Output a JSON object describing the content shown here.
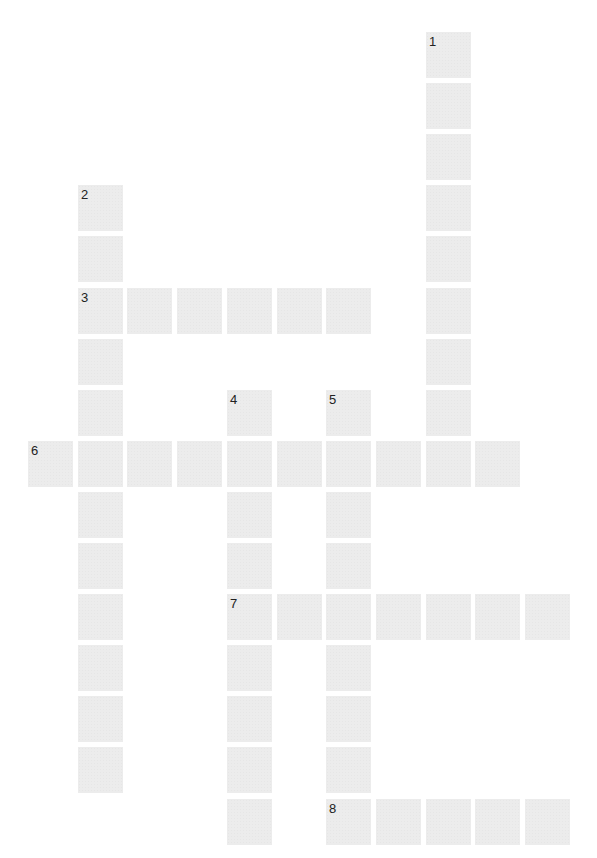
{
  "puzzle": {
    "title": "",
    "cell_color": "#ececec",
    "number_color": "#222222",
    "grid": {
      "col_origin_x": 28,
      "col_pitch": 49.7,
      "row_origin_y": 32,
      "row_pitch": 51.1,
      "cell_width": 45,
      "cell_height": 46
    },
    "words": [
      {
        "number": "1",
        "direction": "down",
        "row": 0,
        "col": 8,
        "length": 8
      },
      {
        "number": "2",
        "direction": "down",
        "row": 3,
        "col": 1,
        "length": 12
      },
      {
        "number": "3",
        "direction": "across",
        "row": 5,
        "col": 1,
        "length": 6
      },
      {
        "number": "4",
        "direction": "down",
        "row": 7,
        "col": 4,
        "length": 9
      },
      {
        "number": "5",
        "direction": "down",
        "row": 7,
        "col": 6,
        "length": 9
      },
      {
        "number": "6",
        "direction": "across",
        "row": 8,
        "col": 0,
        "length": 10
      },
      {
        "number": "7",
        "direction": "across",
        "row": 11,
        "col": 4,
        "length": 7
      },
      {
        "number": "8",
        "direction": "across",
        "row": 15,
        "col": 6,
        "length": 5
      }
    ]
  }
}
